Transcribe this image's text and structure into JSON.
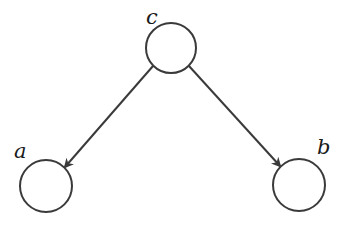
{
  "diagram": {
    "type": "directed-graph",
    "colors": {
      "stroke": "#3a3a3a",
      "label": "#1a1a1a",
      "background": "#ffffff"
    },
    "nodes": [
      {
        "id": "c",
        "label": "c",
        "cx": 171,
        "cy": 48,
        "r": 25,
        "label_x": 146,
        "label_y": 24
      },
      {
        "id": "a",
        "label": "a",
        "cx": 46,
        "cy": 186,
        "r": 26,
        "label_x": 14,
        "label_y": 158
      },
      {
        "id": "b",
        "label": "b",
        "cx": 299,
        "cy": 185,
        "r": 26,
        "label_x": 317,
        "label_y": 154
      }
    ],
    "edges": [
      {
        "from": "c",
        "to": "a",
        "x1": 153,
        "y1": 66,
        "x2": 65,
        "y2": 167
      },
      {
        "from": "c",
        "to": "b",
        "x1": 189,
        "y1": 66,
        "x2": 280,
        "y2": 166
      }
    ]
  }
}
